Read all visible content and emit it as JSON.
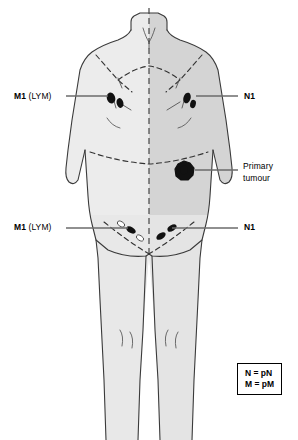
{
  "diagram": {
    "figure_name": "human-torso-anterior-view",
    "colors": {
      "outline": "#3a3a3a",
      "skin_light": "#ececec",
      "skin_mid": "#d8d8d8",
      "skin_dark": "#cfcfcf",
      "node_fill": "#111111",
      "tumour_fill": "#111111",
      "leader_line": "#6b6b6b",
      "dashed_line": "#333333",
      "text": "#000000",
      "background": "#ffffff"
    }
  },
  "labels": {
    "axilla_left": {
      "code": "M1",
      "qualifier": "(LYM)",
      "icon": "leader-line-icon"
    },
    "axilla_right": {
      "code": "N1",
      "icon": "leader-line-icon"
    },
    "primary": {
      "line1": "Primary",
      "line2": "tumour",
      "icon": "leader-line-icon"
    },
    "groin_left": {
      "code": "M1",
      "qualifier": "(LYM)",
      "icon": "leader-line-icon"
    },
    "groin_right": {
      "code": "N1",
      "icon": "leader-line-icon"
    }
  },
  "legend": {
    "rows": [
      "N = pN",
      "M = pM"
    ]
  },
  "markers": {
    "lymph_nodes": [
      {
        "name": "axillary-node-left-1",
        "region": "left-axilla",
        "state": "involved"
      },
      {
        "name": "axillary-node-left-2",
        "region": "left-axilla",
        "state": "involved"
      },
      {
        "name": "axillary-node-right-1",
        "region": "right-axilla",
        "state": "involved"
      },
      {
        "name": "axillary-node-right-2",
        "region": "right-axilla",
        "state": "involved"
      },
      {
        "name": "inguinal-node-left-1",
        "region": "left-groin",
        "state": "involved"
      },
      {
        "name": "inguinal-node-left-2",
        "region": "left-groin",
        "state": "uninvolved"
      },
      {
        "name": "inguinal-node-right-1",
        "region": "right-groin",
        "state": "involved"
      },
      {
        "name": "inguinal-node-right-2",
        "region": "right-groin",
        "state": "involved"
      }
    ],
    "primary_tumour": {
      "name": "primary-tumour-marker",
      "region": "left-upper-abdomen"
    }
  }
}
